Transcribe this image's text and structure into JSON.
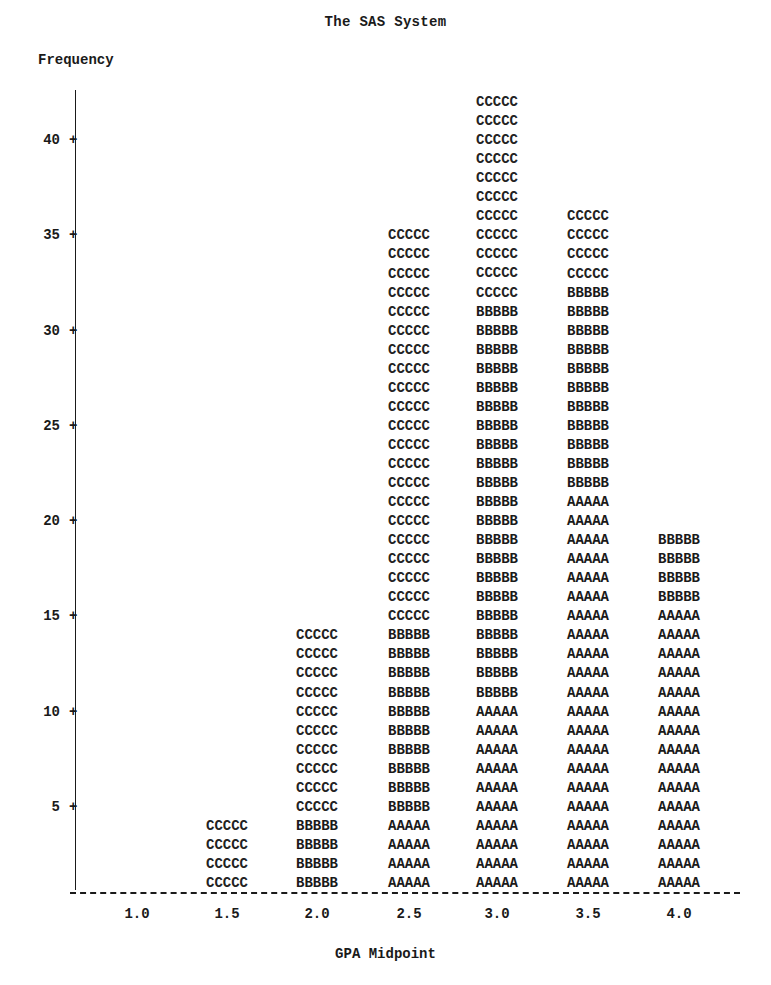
{
  "title": "The SAS System",
  "chart_data": {
    "type": "bar",
    "subtype": "stacked",
    "title": "The SAS System",
    "xlabel": "GPA Midpoint",
    "ylabel": "Frequency",
    "categories": [
      "1.0",
      "1.5",
      "2.0",
      "2.5",
      "3.0",
      "3.5",
      "4.0"
    ],
    "series": [
      {
        "name": "A",
        "symbol": "AAAAA",
        "values": [
          0,
          0,
          0,
          4,
          10,
          21,
          15
        ]
      },
      {
        "name": "B",
        "symbol": "BBBBB",
        "values": [
          0,
          0,
          4,
          10,
          21,
          11,
          4
        ]
      },
      {
        "name": "C",
        "symbol": "CCCCC",
        "values": [
          0,
          4,
          10,
          21,
          11,
          4,
          0
        ]
      }
    ],
    "totals": [
      0,
      4,
      14,
      35,
      42,
      36,
      19
    ],
    "yticks": [
      5,
      10,
      15,
      20,
      25,
      30,
      35,
      40
    ],
    "ylim": [
      0,
      42
    ],
    "grid": false,
    "legend": "none"
  },
  "axis": {
    "ylabel": "Frequency",
    "xlabel": "GPA Midpoint",
    "yticks": [
      "5",
      "10",
      "15",
      "20",
      "25",
      "30",
      "35",
      "40"
    ],
    "xticks": [
      "1.0",
      "1.5",
      "2.0",
      "2.5",
      "3.0",
      "3.5",
      "4.0"
    ]
  }
}
